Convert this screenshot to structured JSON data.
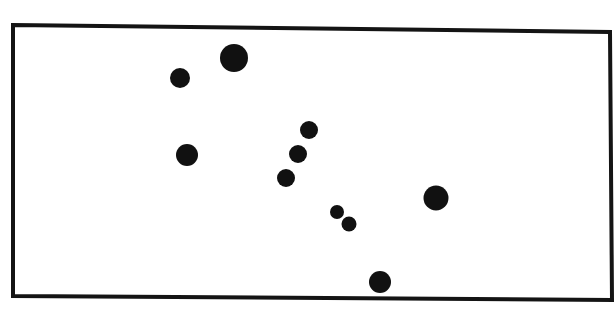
{
  "diagram": {
    "type": "dot-pattern",
    "background": "#ffffff",
    "stroke_color": "#141414",
    "dot_color": "#111111",
    "frame": {
      "points": [
        [
          13,
          25
        ],
        [
          610,
          32
        ],
        [
          612,
          300
        ],
        [
          13,
          296
        ]
      ],
      "stroke_width": 4
    },
    "dots": [
      {
        "cx": 234,
        "cy": 58,
        "r": 14
      },
      {
        "cx": 180,
        "cy": 78,
        "r": 10
      },
      {
        "cx": 187,
        "cy": 155,
        "r": 11
      },
      {
        "cx": 309,
        "cy": 130,
        "r": 9
      },
      {
        "cx": 298,
        "cy": 154,
        "r": 9
      },
      {
        "cx": 286,
        "cy": 178,
        "r": 9
      },
      {
        "cx": 337,
        "cy": 212,
        "r": 7
      },
      {
        "cx": 349,
        "cy": 224,
        "r": 7.5
      },
      {
        "cx": 436,
        "cy": 198,
        "r": 12.5
      },
      {
        "cx": 380,
        "cy": 282,
        "r": 11
      }
    ],
    "dot_count": 10
  }
}
